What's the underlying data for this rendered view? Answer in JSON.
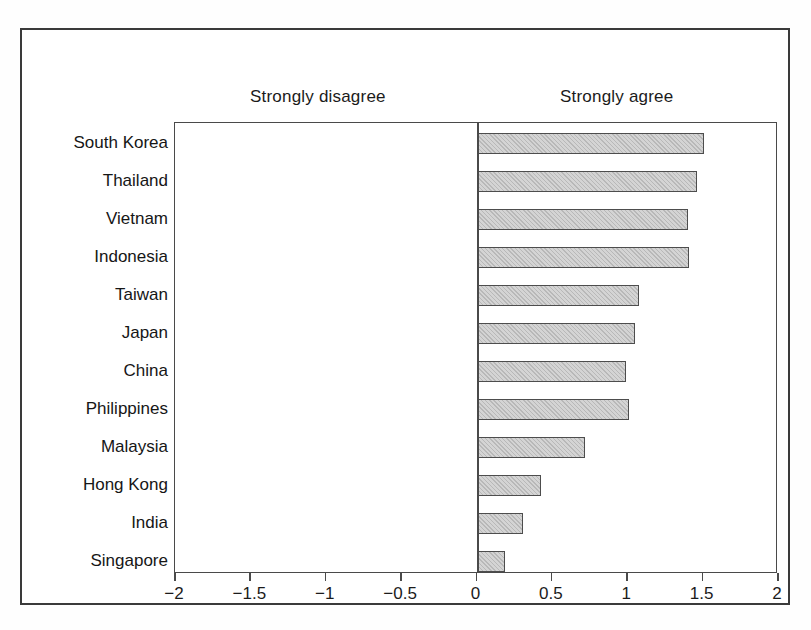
{
  "chart_data": {
    "type": "bar",
    "orientation": "horizontal",
    "title": "",
    "xlabel": "",
    "ylabel": "",
    "xlim": [
      -2,
      2
    ],
    "xticks": [
      -2,
      -1.5,
      -1,
      -0.5,
      0,
      0.5,
      1,
      1.5,
      2
    ],
    "xtick_labels": [
      "−2",
      "−1.5",
      "−1",
      "−0.5",
      "0",
      "0.5",
      "1",
      "1.5",
      "2"
    ],
    "grid": false,
    "legend": null,
    "annotations": [
      {
        "text": "Strongly disagree",
        "side": "left"
      },
      {
        "text": "Strongly agree",
        "side": "right"
      }
    ],
    "categories": [
      "South Korea",
      "Thailand",
      "Vietnam",
      "Indonesia",
      "Taiwan",
      "Japan",
      "China",
      "Philippines",
      "Malaysia",
      "Hong Kong",
      "India",
      "Singapore"
    ],
    "values": [
      1.51,
      1.46,
      1.4,
      1.41,
      1.08,
      1.05,
      0.99,
      1.01,
      0.72,
      0.43,
      0.31,
      0.19
    ]
  },
  "style": {
    "bar_fill": "#d4d4d4",
    "bar_edge": "#4d4d4d",
    "axis_color": "#4a4a4a",
    "frame_color": "#3a3a3a",
    "text_color": "#161616",
    "background": "#ffffff"
  }
}
